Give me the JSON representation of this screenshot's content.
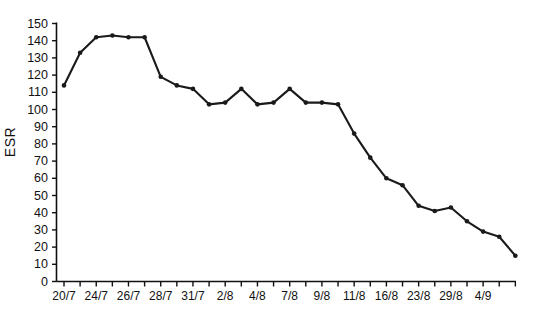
{
  "chart_data": {
    "type": "line",
    "title": "",
    "xlabel": "",
    "ylabel": "ESR",
    "ylim": [
      0,
      150
    ],
    "ytick_values": [
      0,
      10,
      20,
      30,
      40,
      50,
      60,
      70,
      80,
      90,
      100,
      110,
      120,
      130,
      140,
      150
    ],
    "ytick_labels": [
      "0",
      "10",
      "20",
      "30",
      "40",
      "50",
      "60",
      "70",
      "80",
      "90",
      "100",
      "110",
      "120",
      "130",
      "140",
      "150"
    ],
    "grid": false,
    "legend": "none",
    "marker": "filled-circle",
    "line_color": "#1a1a1a",
    "categories": [
      "20/7",
      "21/7",
      "22/7",
      "23/7",
      "24/7",
      "25/7",
      "26/7",
      "27/7",
      "28/7",
      "29/7",
      "31/7",
      "1/8",
      "2/8",
      "3/8",
      "4/8",
      "5/8",
      "7/8",
      "8/8",
      "9/8",
      "10/8",
      "11/8",
      "14/8",
      "16/8",
      "18/8",
      "23/8",
      "25/8",
      "29/8",
      "1/9",
      "4/9"
    ],
    "values": [
      114,
      133,
      142,
      143,
      142,
      142,
      119,
      114,
      112,
      103,
      104,
      112,
      103,
      104,
      112,
      104,
      104,
      103,
      86,
      72,
      60,
      56,
      44,
      41,
      43,
      35,
      29,
      26,
      15
    ],
    "xtick_labels_shown": [
      {
        "label": "20/7",
        "index": 0
      },
      {
        "label": "24/7",
        "index": 2
      },
      {
        "label": "26/7",
        "index": 4
      },
      {
        "label": "28/7",
        "index": 6
      },
      {
        "label": "31/7",
        "index": 8
      },
      {
        "label": "2/8",
        "index": 10
      },
      {
        "label": "4/8",
        "index": 12
      },
      {
        "label": "7/8",
        "index": 14
      },
      {
        "label": "9/8",
        "index": 16
      },
      {
        "label": "11/8",
        "index": 18
      },
      {
        "label": "16/8",
        "index": 20
      },
      {
        "label": "23/8",
        "index": 22
      },
      {
        "label": "29/8",
        "index": 24
      },
      {
        "label": "4/9",
        "index": 26
      }
    ]
  }
}
